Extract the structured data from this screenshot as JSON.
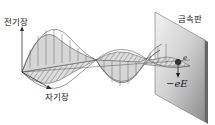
{
  "labels": {
    "electric_field": "전기장",
    "magnetic_field": "자기장",
    "metal_plate": "금속판",
    "electron": "e",
    "force": "−eE"
  },
  "colors": {
    "wave_fill": "#d4d4d4",
    "wave_stroke": "#555555",
    "plate_light": "#e6e6e6",
    "plate_dark": "#8a8a8a",
    "text": "#222222"
  }
}
